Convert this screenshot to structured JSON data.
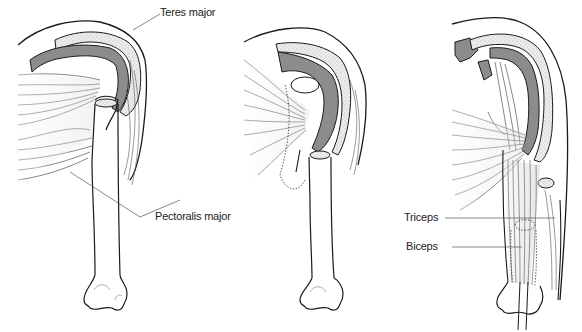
{
  "figure": {
    "panels": [
      {
        "id": "panel-1",
        "labels": [
          "Teres major",
          "Pectoralis major"
        ]
      },
      {
        "id": "panel-2",
        "labels": []
      },
      {
        "id": "panel-3",
        "labels": [
          "Triceps",
          "Biceps"
        ]
      }
    ]
  },
  "labels": {
    "teres_major": "Teres major",
    "pectoralis_major": "Pectoralis major",
    "triceps": "Triceps",
    "biceps": "Biceps"
  },
  "colors": {
    "outline": "#1a1a1a",
    "muscle_dark": "#8c8c8c",
    "muscle_mid": "#bdbdbd",
    "bone_stipple": "#e4e4e4",
    "leader": "#555555",
    "background": "#ffffff"
  }
}
